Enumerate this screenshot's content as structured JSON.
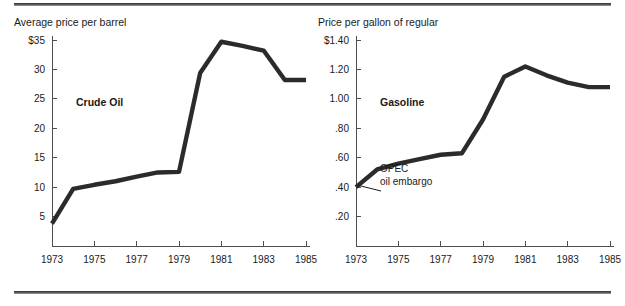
{
  "figure": {
    "divider_top": "horizontal-rule",
    "divider_bottom": "horizontal-rule"
  },
  "chart_data": [
    {
      "type": "line",
      "panel": "left",
      "title": "Average price per barrel",
      "series_label": "Crude Oil",
      "xlabel": "",
      "ylabel": "",
      "x": [
        1973,
        1974,
        1975,
        1976,
        1977,
        1978,
        1979,
        1980,
        1981,
        1982,
        1983,
        1984,
        1985
      ],
      "values": [
        3.8,
        9.7,
        10.4,
        11.0,
        11.8,
        12.5,
        12.6,
        29.4,
        34.7,
        34.0,
        33.2,
        28.2,
        28.2
      ],
      "series": [
        {
          "name": "Crude Oil",
          "values": [
            3.8,
            9.7,
            10.4,
            11.0,
            11.8,
            12.5,
            12.6,
            29.4,
            34.7,
            34.0,
            33.2,
            28.2,
            28.2
          ]
        }
      ],
      "xlim": [
        1973,
        1985
      ],
      "ylim": [
        0,
        35
      ],
      "xticks": [
        1973,
        1974,
        1975,
        1976,
        1977,
        1978,
        1979,
        1980,
        1981,
        1982,
        1983,
        1984,
        1985
      ],
      "xticklabels": [
        "1973",
        "",
        "1975",
        "",
        "1977",
        "",
        "1979",
        "",
        "1981",
        "",
        "1983",
        "",
        "1985"
      ],
      "yticks": [
        5,
        10,
        15,
        20,
        25,
        30,
        35
      ],
      "yticklabels": [
        "5",
        "10",
        "15",
        "20",
        "25",
        "30",
        "$35"
      ],
      "grid": false,
      "legend": "inline-label",
      "annotations": []
    },
    {
      "type": "line",
      "panel": "right",
      "title": "Price per gallon of regular",
      "series_label": "Gasoline",
      "xlabel": "",
      "ylabel": "",
      "x": [
        1973,
        1974,
        1975,
        1976,
        1977,
        1978,
        1979,
        1980,
        1981,
        1982,
        1983,
        1984,
        1985
      ],
      "values": [
        0.4,
        0.52,
        0.56,
        0.59,
        0.62,
        0.63,
        0.86,
        1.15,
        1.22,
        1.16,
        1.11,
        1.08,
        1.08
      ],
      "series": [
        {
          "name": "Gasoline",
          "values": [
            0.4,
            0.52,
            0.56,
            0.59,
            0.62,
            0.63,
            0.86,
            1.15,
            1.22,
            1.16,
            1.11,
            1.08,
            1.08
          ]
        }
      ],
      "xlim": [
        1973,
        1985
      ],
      "ylim": [
        0,
        1.4
      ],
      "xticks": [
        1973,
        1974,
        1975,
        1976,
        1977,
        1978,
        1979,
        1980,
        1981,
        1982,
        1983,
        1984,
        1985
      ],
      "xticklabels": [
        "1973",
        "",
        "1975",
        "",
        "1977",
        "",
        "1979",
        "",
        "1981",
        "",
        "1983",
        "",
        "1985"
      ],
      "yticks": [
        0.2,
        0.4,
        0.6,
        0.8,
        1.0,
        1.2,
        1.4
      ],
      "yticklabels": [
        ".20",
        ".40",
        ".60",
        ".80",
        "1.00",
        "1.20",
        "$1.40"
      ],
      "grid": false,
      "legend": "inline-label",
      "annotations": [
        {
          "text_line1": "OPEC",
          "text_line2": "oil embargo",
          "target_x": 1973,
          "target_y": 0.4
        }
      ]
    }
  ]
}
